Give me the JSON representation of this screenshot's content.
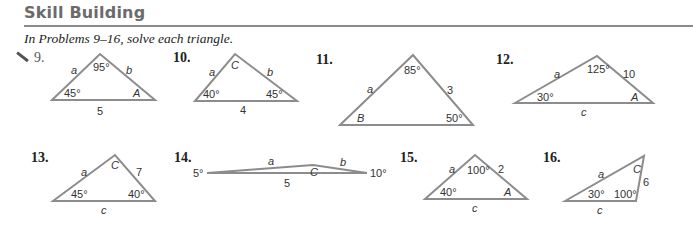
{
  "header": {
    "title": "Skill Building",
    "instruction": "In Problems 9–16, solve each triangle."
  },
  "problems": [
    {
      "number": "9.",
      "labels": {
        "left_side": "a",
        "top_angle": "95°",
        "right_side": "b",
        "left_angle": "45°",
        "right_angle": "A",
        "base": "5"
      }
    },
    {
      "number": "10.",
      "labels": {
        "left_side": "a",
        "top_angle": "C",
        "right_side": "b",
        "left_angle": "40°",
        "right_angle": "45°",
        "base": "4"
      }
    },
    {
      "number": "11.",
      "labels": {
        "left_side": "a",
        "top_angle": "85°",
        "right_side": "3",
        "left_angle": "B",
        "right_angle": "50°"
      }
    },
    {
      "number": "12.",
      "labels": {
        "left_side": "a",
        "top_angle": "125°",
        "right_side": "10",
        "left_angle": "30°",
        "right_angle": "A",
        "base": "c"
      }
    },
    {
      "number": "13.",
      "labels": {
        "left_side": "a",
        "top_angle": "C",
        "right_side": "7",
        "left_angle": "45°",
        "right_angle": "40°",
        "base": "c"
      }
    },
    {
      "number": "14.",
      "labels": {
        "left_side": "a",
        "top_angle": "C",
        "right_side": "b",
        "left_angle": "5°",
        "right_angle": "10°",
        "base": "5"
      }
    },
    {
      "number": "15.",
      "labels": {
        "left_side": "a",
        "top_angle": "100°",
        "right_side": "2",
        "left_angle": "40°",
        "right_angle": "A",
        "base": "c"
      }
    },
    {
      "number": "16.",
      "labels": {
        "left_side": "a",
        "top_angle": "C",
        "right_side": "6",
        "left_angle": "30°",
        "right_angle": "100°",
        "base": "c"
      }
    }
  ],
  "colors": {
    "triangle_stroke": "#8c8c8c",
    "title": "#6b6b6b",
    "rule": "#8a8a8a"
  }
}
